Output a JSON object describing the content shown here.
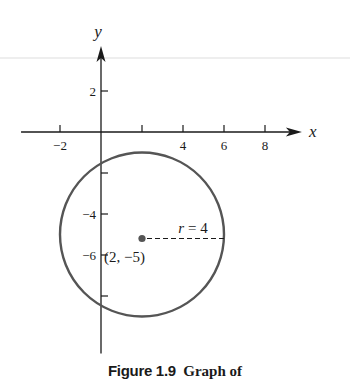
{
  "figure": {
    "caption_number": "Figure 1.9",
    "caption_text": "Graph of",
    "colors": {
      "axis": "#1a1a1a",
      "circle": "#555555",
      "center_dot": "#555555",
      "text": "#1a1a1a",
      "top_rule": "#dddddd"
    }
  },
  "chart_data": {
    "type": "line",
    "title": "",
    "xlabel": "x",
    "ylabel": "y",
    "xlim": [
      -3.9,
      9.8
    ],
    "ylim": [
      -10.8,
      4.2
    ],
    "x_ticks": [
      {
        "value": -2,
        "label": "−2"
      },
      {
        "value": 2,
        "label": ""
      },
      {
        "value": 4,
        "label": "4"
      },
      {
        "value": 6,
        "label": "6"
      },
      {
        "value": 8,
        "label": "8"
      }
    ],
    "y_ticks": [
      {
        "value": 2,
        "label": "2"
      },
      {
        "value": -2,
        "label": ""
      },
      {
        "value": -4,
        "label": "−4"
      },
      {
        "value": -6,
        "label": "−6"
      },
      {
        "value": -8,
        "label": ""
      }
    ],
    "grid": false,
    "shapes": [
      {
        "kind": "circle",
        "center": [
          2,
          -5
        ],
        "radius": 4
      }
    ],
    "points": [
      {
        "x": 2,
        "y": -5,
        "label": "(2, −5)"
      }
    ],
    "annotations": [
      {
        "kind": "radius-dashed-line",
        "from": [
          2,
          -5
        ],
        "to": [
          6,
          -5
        ],
        "label_var": "r",
        "label_rest": " = 4"
      }
    ]
  }
}
